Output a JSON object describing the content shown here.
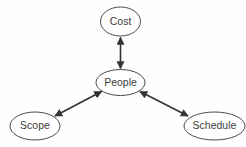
{
  "diagram": {
    "background_color": "#fefefe",
    "node_fill": "#ffffff",
    "node_stroke": "#4a4a4a",
    "edge_color": "#333333",
    "label_color": "#3c3c3c",
    "nodes": [
      {
        "id": "cost",
        "label": "Cost",
        "cx": 120.5,
        "cy": 21.5,
        "rx": 20.0,
        "ry": 14.5
      },
      {
        "id": "people",
        "label": "People",
        "cx": 120.5,
        "cy": 82.5,
        "rx": 24.5,
        "ry": 13.0
      },
      {
        "id": "scope",
        "label": "Scope",
        "cx": 35.0,
        "cy": 126.0,
        "rx": 25.0,
        "ry": 14.0
      },
      {
        "id": "schedule",
        "label": "Schedule",
        "cx": 214.5,
        "cy": 126.0,
        "rx": 30.5,
        "ry": 14.0
      }
    ],
    "edges": [
      {
        "id": "people-cost",
        "from": "people",
        "to": "cost",
        "arrow": "double"
      },
      {
        "id": "people-scope",
        "from": "people",
        "to": "scope",
        "arrow": "double"
      },
      {
        "id": "people-schedule",
        "from": "people",
        "to": "schedule",
        "arrow": "double"
      }
    ]
  }
}
